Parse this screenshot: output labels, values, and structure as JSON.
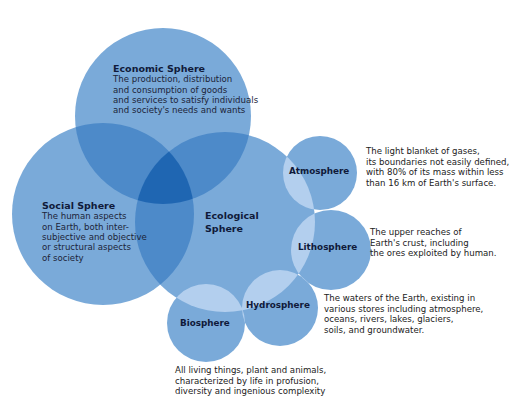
{
  "colors": {
    "circle_base": "#7aaad9",
    "overlap_two": "#4d8ac9",
    "overlap_three": "#1f66b2",
    "small_lens": "#b3cfee",
    "text_dark": "#101a3a"
  },
  "spheres": {
    "economic": {
      "title": "Economic Sphere",
      "lines": [
        "The production, distribution",
        "and consumption of goods",
        "and services to satisfy individuals",
        "and society's needs and wants"
      ]
    },
    "social": {
      "title": "Social Sphere",
      "lines": [
        "The human aspects",
        "on Earth, both inter-",
        "subjective and objective",
        "or structural aspects",
        "of society"
      ]
    },
    "ecological": {
      "title_line1": "Ecological",
      "title_line2": "Sphere"
    },
    "atmosphere": {
      "title": "Atmosphere",
      "lines": [
        "The light blanket of gases,",
        "its boundaries not easily defined,",
        "with 80% of its mass within less",
        "than 16 km of Earth's surface."
      ]
    },
    "lithosphere": {
      "title": "Lithosphere",
      "lines": [
        "The upper reaches of",
        "Earth's crust, including",
        "the ores exploited by human."
      ]
    },
    "hydrosphere": {
      "title": "Hydrosphere",
      "lines": [
        "The waters of the Earth, existing in",
        "various stores including atmosphere,",
        "oceans, rivers, lakes, glaciers,",
        "soils, and groundwater."
      ]
    },
    "biosphere": {
      "title": "Biosphere",
      "lines": [
        "All living things, plant and animals,",
        "characterized by life in profusion,",
        "diversity and ingenious complexity"
      ]
    }
  }
}
